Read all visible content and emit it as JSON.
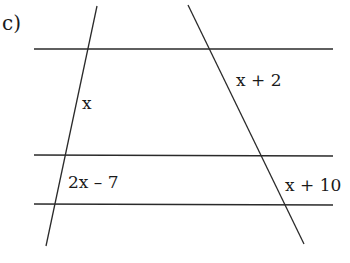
{
  "part_label": "c)",
  "diagram": {
    "parallel_lines": [
      {
        "y": 49,
        "x1": 34,
        "x2": 333
      },
      {
        "y": 155,
        "x1": 34,
        "x2": 333
      },
      {
        "y": 204,
        "x1": 34,
        "x2": 333
      }
    ],
    "transversals": [
      {
        "name": "left",
        "x1": 97,
        "y1": 6,
        "x2": 46,
        "y2": 246
      },
      {
        "name": "right",
        "x1": 188,
        "y1": 5,
        "x2": 304,
        "y2": 244
      }
    ],
    "labels": [
      {
        "id": "left-upper",
        "text": "x",
        "x": 82,
        "y": 109
      },
      {
        "id": "right-upper",
        "text": "x + 2",
        "x": 236,
        "y": 86
      },
      {
        "id": "left-lower",
        "text": "2x – 7",
        "x": 68,
        "y": 188
      },
      {
        "id": "right-lower",
        "text": "x + 10",
        "x": 285,
        "y": 191
      }
    ]
  }
}
